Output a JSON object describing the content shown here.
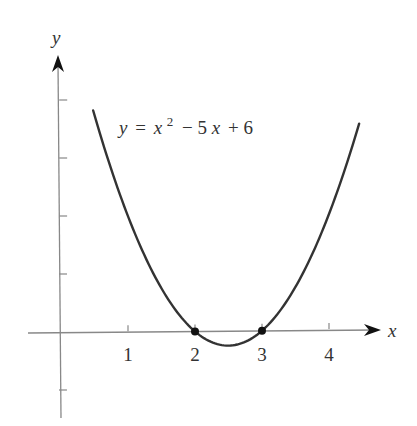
{
  "chart_data": {
    "type": "line",
    "title": "",
    "equation_label": {
      "y": "y",
      "eq": "=",
      "x": "x",
      "exp": "2",
      "rest1": "− 5",
      "rest1_x": "x",
      "rest2": "+ 6",
      "full": "y = x^2 − 5x + 6"
    },
    "xlabel": "x",
    "ylabel": "y",
    "xlim": [
      -0.5,
      4.8
    ],
    "ylim": [
      -1.3,
      4.7
    ],
    "x_ticks": [
      1,
      2,
      3,
      4
    ],
    "x_tick_labels": [
      "1",
      "2",
      "3",
      "4"
    ],
    "y_ticks": [
      -1,
      1,
      2,
      3,
      4
    ],
    "y_tick_labels": [],
    "grid": false,
    "legend": null,
    "series": [
      {
        "name": "y = x^2 − 5x + 6",
        "function": "x^2 - 5x + 6",
        "x_range": [
          0.48,
          4.45
        ],
        "color": "#333333",
        "sample_points": [
          {
            "x": 0.5,
            "y": 3.75
          },
          {
            "x": 1,
            "y": 2
          },
          {
            "x": 1.5,
            "y": 0.75
          },
          {
            "x": 2,
            "y": 0
          },
          {
            "x": 2.5,
            "y": -0.25
          },
          {
            "x": 3,
            "y": 0
          },
          {
            "x": 3.5,
            "y": 0.75
          },
          {
            "x": 4,
            "y": 2
          },
          {
            "x": 4.45,
            "y": 3.55
          }
        ]
      }
    ],
    "marked_points": [
      {
        "x": 2,
        "y": 0,
        "label": "root"
      },
      {
        "x": 3,
        "y": 0,
        "label": "root"
      }
    ],
    "colors": {
      "curve": "#333333",
      "axis": "#888888",
      "text": "#333333",
      "background": "#ffffff"
    }
  },
  "geometry": {
    "origin_px": [
      61,
      332
    ],
    "unit_x_px": 67,
    "unit_y_px": 58,
    "x_axis_start_px": 28,
    "x_axis_end_px": 381,
    "y_axis_top_px": 55,
    "y_axis_bottom_px": 418
  }
}
